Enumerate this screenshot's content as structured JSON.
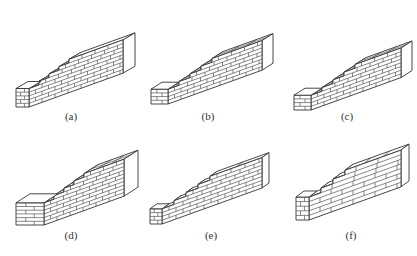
{
  "figure": {
    "panels": [
      {
        "id": "a",
        "label": "(a)",
        "steps": 4,
        "courses": 8,
        "type": "stepped"
      },
      {
        "id": "b",
        "label": "(b)",
        "steps": 4,
        "courses": 8,
        "type": "stepped"
      },
      {
        "id": "c",
        "label": "(c)",
        "steps": 4,
        "courses": 8,
        "type": "stepped"
      },
      {
        "id": "d",
        "label": "(d)",
        "steps": 4,
        "courses": 10,
        "type": "stepped-thick"
      },
      {
        "id": "e",
        "label": "(e)",
        "steps": 4,
        "courses": 8,
        "type": "stepped-thin"
      },
      {
        "id": "f",
        "label": "(f)",
        "steps": 3,
        "courses": 8,
        "type": "large-block"
      }
    ]
  },
  "colors": {
    "line": "#555555",
    "outline": "#333333",
    "background": "#ffffff",
    "label": "#333333"
  }
}
